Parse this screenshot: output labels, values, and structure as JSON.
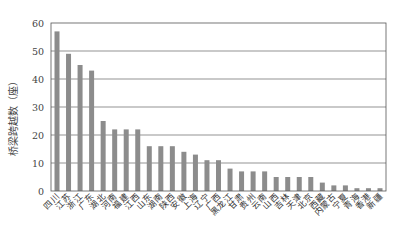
{
  "chart_data": {
    "type": "bar",
    "title": "",
    "xlabel": "",
    "ylabel": "桥梁跨越数（座）",
    "ylim": [
      0,
      60
    ],
    "yticks": [
      0,
      10,
      20,
      30,
      40,
      50,
      60
    ],
    "grid": true,
    "legend": null,
    "bar_color": "#8c8c8c",
    "categories": [
      "四川",
      "江苏",
      "浙江",
      "广东",
      "湖北",
      "河南",
      "福建",
      "江西",
      "山东",
      "湖南",
      "陕西",
      "安徽",
      "上海",
      "辽宁",
      "广西",
      "黑龙江",
      "甘肃",
      "贵州",
      "云南",
      "山西",
      "吉林",
      "天津",
      "北京",
      "西藏",
      "内蒙古",
      "宁夏",
      "青海",
      "香港",
      "新疆"
    ],
    "values": [
      57,
      49,
      45,
      43,
      25,
      22,
      22,
      22,
      16,
      16,
      16,
      14,
      13,
      11,
      11,
      8,
      7,
      7,
      7,
      5,
      5,
      5,
      5,
      3,
      2,
      2,
      1,
      1,
      1
    ]
  }
}
